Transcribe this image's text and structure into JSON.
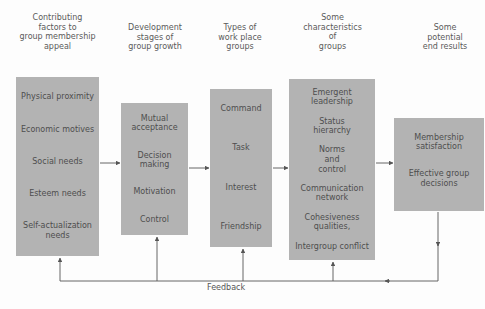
{
  "headers": [
    "Contributing\nfactors to\ngroup membership\nappeal",
    "Development\nstages of\ngroup growth",
    "Types of\nwork place\ngroups",
    "Some\ncharacteristics\nof\ngroups",
    "Some\npotential\nend results"
  ],
  "boxes": [
    {
      "items": [
        "Physical proximity",
        "Economic motives",
        "Social needs",
        "Esteem needs",
        "Self-actualization\nneeds"
      ]
    },
    {
      "items": [
        "Mutual\nacceptance",
        "Decision\nmaking",
        "Motivation",
        "Control"
      ]
    },
    {
      "items": [
        "Command",
        "Task",
        "Interest",
        "Friendship"
      ]
    },
    {
      "items": [
        "Emergent\nleadership",
        "Status\nhierarchy",
        "Norms\nand\ncontrol",
        "Communication\nnetwork",
        "Cohesiveness\nqualities,",
        "Intergroup conflict"
      ]
    },
    {
      "items": [
        "Membership\nsatisfaction",
        "Effective group\ndecisions"
      ]
    }
  ],
  "feedback_label": "Feedback",
  "colors": {
    "box_fill": "#b3b3b3",
    "line": "#555555",
    "background": "#fdfdfd"
  }
}
